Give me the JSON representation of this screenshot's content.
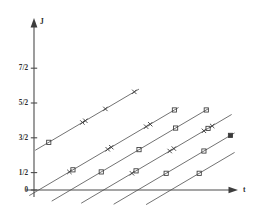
{
  "chart_data": {
    "type": "line",
    "title": "",
    "subtitle": "",
    "xlabel": "t",
    "ylabel": "J",
    "xlim": [
      -0.35,
      3.4
    ],
    "ylim": [
      -0.55,
      5.6
    ],
    "grid": false,
    "legend": null,
    "annotations": [],
    "x_axis": {
      "label": "t",
      "ticks": [],
      "tick_labels": [],
      "arrow": true,
      "axis_value": 0
    },
    "y_axis": {
      "label": "J",
      "ticks": [
        0,
        0.5,
        1.5,
        2.5,
        3.5
      ],
      "tick_labels": [
        "0",
        "1/2",
        "3/2",
        "5/2",
        "7/2"
      ],
      "arrow": true,
      "axis_value": 0
    },
    "series": [
      {
        "name": "trajectory-1",
        "slope": 1.0,
        "intercept": 1.12,
        "x_start": 0.02,
        "x_end": 1.78,
        "points": [
          {
            "x": 0.25,
            "y": 1.37,
            "marker": "square"
          },
          {
            "x": 0.82,
            "y": 1.94,
            "marker": "cross"
          },
          {
            "x": 0.87,
            "y": 1.99,
            "marker": "cross"
          },
          {
            "x": 1.21,
            "y": 2.33,
            "marker": "cross"
          },
          {
            "x": 1.7,
            "y": 2.82,
            "marker": "cross"
          }
        ]
      },
      {
        "name": "trajectory-2",
        "slope": 1.0,
        "intercept": -0.08,
        "x_start": -0.08,
        "x_end": 2.45,
        "points": [
          {
            "x": 0.6,
            "y": 0.52,
            "marker": "cross"
          },
          {
            "x": 0.66,
            "y": 0.58,
            "marker": "square"
          },
          {
            "x": 1.25,
            "y": 1.17,
            "marker": "cross"
          },
          {
            "x": 1.31,
            "y": 1.23,
            "marker": "cross"
          },
          {
            "x": 1.9,
            "y": 1.82,
            "marker": "cross"
          },
          {
            "x": 1.97,
            "y": 1.89,
            "marker": "cross"
          },
          {
            "x": 2.38,
            "y": 2.3,
            "marker": "square"
          }
        ]
      },
      {
        "name": "trajectory-3",
        "slope": 1.0,
        "intercept": -0.62,
        "x_start": 0.3,
        "x_end": 2.95,
        "points": [
          {
            "x": 1.14,
            "y": 0.52,
            "marker": "square"
          },
          {
            "x": 1.78,
            "y": 1.16,
            "marker": "square"
          },
          {
            "x": 2.4,
            "y": 1.78,
            "marker": "square"
          },
          {
            "x": 2.92,
            "y": 2.3,
            "marker": "square"
          }
        ]
      },
      {
        "name": "trajectory-4",
        "slope": 1.0,
        "intercept": -1.18,
        "x_start": 0.8,
        "x_end": 3.35,
        "points": [
          {
            "x": 1.66,
            "y": 0.48,
            "marker": "cross"
          },
          {
            "x": 1.73,
            "y": 0.55,
            "marker": "square"
          },
          {
            "x": 2.3,
            "y": 1.12,
            "marker": "cross"
          },
          {
            "x": 2.37,
            "y": 1.19,
            "marker": "cross"
          },
          {
            "x": 2.88,
            "y": 1.7,
            "marker": "cross"
          },
          {
            "x": 2.95,
            "y": 1.77,
            "marker": "square"
          },
          {
            "x": 3.02,
            "y": 1.84,
            "marker": "cross"
          }
        ]
      },
      {
        "name": "trajectory-5",
        "slope": 1.0,
        "intercept": -1.76,
        "x_start": 1.35,
        "x_end": 3.4,
        "points": [
          {
            "x": 2.24,
            "y": 0.48,
            "marker": "square"
          },
          {
            "x": 2.88,
            "y": 1.12,
            "marker": "square"
          },
          {
            "x": 3.33,
            "y": 1.57,
            "marker": "square-filled"
          }
        ]
      },
      {
        "name": "trajectory-6",
        "slope": 1.0,
        "intercept": -2.32,
        "x_start": 1.9,
        "x_end": 3.4,
        "points": [
          {
            "x": 2.8,
            "y": 0.48,
            "marker": "square"
          }
        ]
      }
    ],
    "marker_legend": {
      "cross": "x-marker",
      "square": "open-square-marker",
      "square-filled": "filled-square-marker"
    }
  }
}
